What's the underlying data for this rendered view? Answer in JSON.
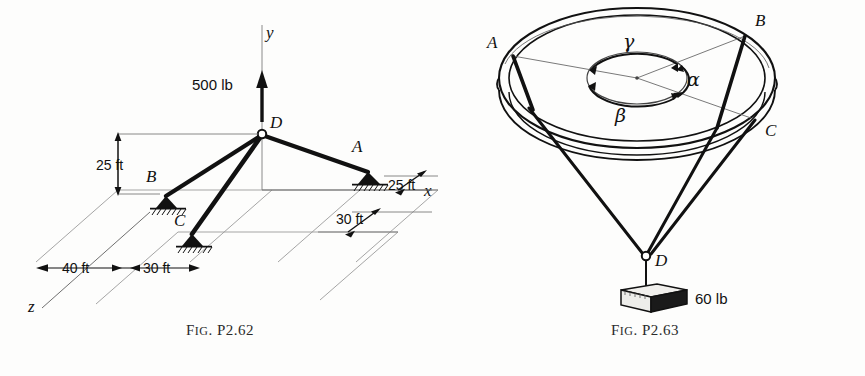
{
  "page": {
    "background": "#fdfdfc",
    "ink": "#111111"
  },
  "figures": [
    {
      "id": "fig-p2-62",
      "caption_prefix": "F",
      "caption_smallcaps": "IG",
      "caption_rest": ". P2.62",
      "caption_full": "FIG. P2.62",
      "axes": {
        "y_label": "y",
        "x_label": "x",
        "z_label": "z"
      },
      "joints": {
        "d": "D",
        "a": "A",
        "b": "B",
        "c": "C"
      },
      "load": {
        "magnitude": "500 lb",
        "direction": "up"
      },
      "dimensions": {
        "height": "25 ft",
        "z_far": "40 ft",
        "z_near": "30 ft",
        "x_near": "25 ft",
        "x_far": "30 ft"
      }
    },
    {
      "id": "fig-p2-63",
      "caption_prefix": "F",
      "caption_smallcaps": "IG",
      "caption_rest": ". P2.63",
      "caption_full": "FIG. P2.63",
      "joints": {
        "a": "A",
        "b": "B",
        "c": "C",
        "d": "D"
      },
      "angles": {
        "alpha": "α",
        "beta": "β",
        "gamma": "γ"
      },
      "load": {
        "magnitude": "60 lb"
      }
    }
  ]
}
